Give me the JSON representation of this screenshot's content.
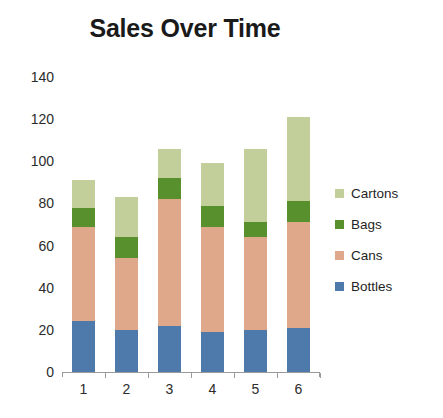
{
  "chart_data": {
    "type": "bar",
    "stacked": true,
    "title": "Sales Over Time",
    "xlabel": "",
    "ylabel": "",
    "categories": [
      "1",
      "2",
      "3",
      "4",
      "5",
      "6"
    ],
    "ylim": [
      0,
      140
    ],
    "yticks": [
      0,
      20,
      40,
      60,
      80,
      100,
      120,
      140
    ],
    "ytick_labels": [
      "0",
      "20",
      "40",
      "60",
      "80",
      "100",
      "120",
      "140"
    ],
    "grid": false,
    "legend_position": "right",
    "series": [
      {
        "name": "Bottles",
        "color": "#4d79ab",
        "values": [
          24,
          20,
          22,
          19,
          20,
          21
        ]
      },
      {
        "name": "Cans",
        "color": "#e0a88b",
        "values": [
          45,
          34,
          60,
          50,
          44,
          50
        ]
      },
      {
        "name": "Bags",
        "color": "#57902c",
        "values": [
          9,
          10,
          10,
          10,
          7,
          10
        ]
      },
      {
        "name": "Cartons",
        "color": "#c3cf9a",
        "values": [
          13,
          19,
          14,
          20,
          35,
          40
        ]
      }
    ],
    "totals": [
      91,
      83,
      106,
      98,
      105,
      121
    ],
    "legend": [
      {
        "label": "Cartons",
        "color": "#c3cf9a"
      },
      {
        "label": "Bags",
        "color": "#57902c"
      },
      {
        "label": "Cans",
        "color": "#e0a88b"
      },
      {
        "label": "Bottles",
        "color": "#4d79ab"
      }
    ]
  },
  "colors": {
    "background": "#ffffff",
    "axis": "#9a9a9a",
    "text": "#2b2b2b",
    "title": "#1a1a1a"
  }
}
